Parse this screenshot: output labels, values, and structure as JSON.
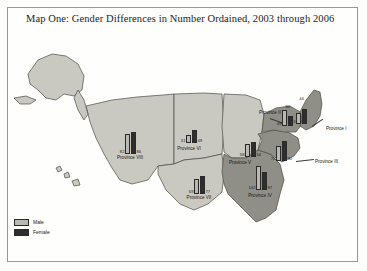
{
  "title": "Map One: Gender Differences in Number Ordained, 2003 through 2006",
  "legend": {
    "items": [
      {
        "key": "male",
        "label": "Male",
        "color": "#b9b9b2"
      },
      {
        "key": "female",
        "label": "Female",
        "color": "#2e2e2e"
      }
    ]
  },
  "colors": {
    "land_light": "#c9c9c2",
    "land_dark": "#8f8f88",
    "outline": "#4a4a45",
    "frame": "#9a9a92",
    "male_bar": "#b9b9b2",
    "female_bar": "#2e2e2e"
  },
  "chart_data": {
    "type": "bar",
    "title": "Map One: Gender Differences in Number Ordained, 2003 through 2006",
    "xlabel": "",
    "ylabel": "Number Ordained",
    "categories": [
      "Province I",
      "Province II",
      "Province III",
      "Province IV",
      "Province V",
      "Province VI",
      "Province VII",
      "Province VIII"
    ],
    "series": [
      {
        "name": "Male",
        "values": [
          33,
          48,
          70,
          142,
          58,
          31,
          69,
          82
        ]
      },
      {
        "name": "Female",
        "values": [
          44,
          30,
          90,
          97,
          54,
          49,
          77,
          86
        ]
      }
    ],
    "legend_position": "bottom-left",
    "grid": false
  },
  "provinces": [
    {
      "id": "province-i",
      "label": "Province I",
      "male": 33,
      "female": 44,
      "label_x": 318,
      "label_y": 93,
      "bar_x": 288,
      "bar_y": 68,
      "bar_h": 22,
      "male_h": 11,
      "female_h": 15,
      "male_num_pos": "left",
      "female_num_pos": "top",
      "leader": {
        "x": 304,
        "y": 92,
        "len": 13,
        "angle": -34
      }
    },
    {
      "id": "province-ii",
      "label": "Province II",
      "male": 48,
      "female": 30,
      "label_x": 251,
      "label_y": 77,
      "bar_x": 274,
      "bar_y": 76,
      "bar_h": 16,
      "male_h": 16,
      "female_h": 10,
      "male_num_pos": "left",
      "female_num_pos": "top",
      "leader": {
        "x": 262,
        "y": 84,
        "len": 14,
        "angle": 20
      }
    },
    {
      "id": "province-iii",
      "label": "Province III",
      "male": 70,
      "female": 90,
      "label_x": 307,
      "label_y": 126,
      "bar_x": 268,
      "bar_y": 105,
      "bar_h": 22,
      "male_h": 15,
      "female_h": 20,
      "male_num_pos": "left",
      "female_num_pos": "right",
      "leader": {
        "x": 288,
        "y": 127,
        "len": 18,
        "angle": -6
      }
    },
    {
      "id": "province-iv",
      "label": "Province IV",
      "male": 142,
      "female": 97,
      "label_x": 252,
      "label_y": 160,
      "bar_x": 248,
      "bar_y": 132,
      "bar_h": 24,
      "male_h": 24,
      "female_h": 18,
      "male_num_pos": "left",
      "female_num_pos": "right"
    },
    {
      "id": "province-v",
      "label": "Province V",
      "male": 58,
      "female": 54,
      "label_x": 232,
      "label_y": 127,
      "bar_x": 237,
      "bar_y": 108,
      "bar_h": 15,
      "male_h": 13,
      "female_h": 15,
      "male_num_pos": "left",
      "female_num_pos": "right"
    },
    {
      "id": "province-vi",
      "label": "Province VI",
      "male": 31,
      "female": 49,
      "label_x": 181,
      "label_y": 113,
      "bar_x": 178,
      "bar_y": 96,
      "bar_h": 13,
      "male_h": 8,
      "female_h": 13,
      "male_num_pos": "left",
      "female_num_pos": "right"
    },
    {
      "id": "province-vii",
      "label": "Province VII",
      "male": 69,
      "female": 77,
      "label_x": 191,
      "label_y": 162,
      "bar_x": 186,
      "bar_y": 142,
      "bar_h": 18,
      "male_h": 15,
      "female_h": 18,
      "male_num_pos": "left",
      "female_num_pos": "right"
    },
    {
      "id": "province-viii",
      "label": "Province VIII",
      "male": 82,
      "female": 86,
      "label_x": 122,
      "label_y": 122,
      "bar_x": 117,
      "bar_y": 98,
      "bar_h": 22,
      "male_h": 20,
      "female_h": 22,
      "male_num_pos": "left",
      "female_num_pos": "right"
    }
  ]
}
